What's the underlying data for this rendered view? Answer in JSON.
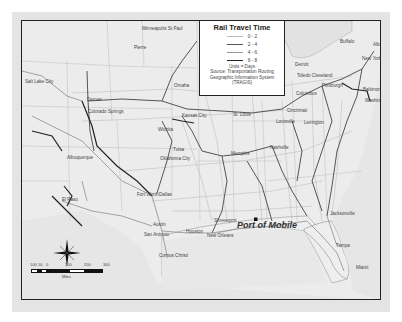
{
  "map": {
    "title": "Rail Travel Time",
    "legend": {
      "title": "Rail Travel Time",
      "classes": [
        {
          "label": "0 - 2",
          "color": "#bdbdbd",
          "width": 0.6
        },
        {
          "label": "2 - 4",
          "color": "#555555",
          "width": 1.0
        },
        {
          "label": "4 - 6",
          "color": "#9a9a9a",
          "width": 0.8
        },
        {
          "label": "6 - 8",
          "color": "#222222",
          "width": 1.3
        }
      ],
      "units": "Units = Days",
      "source_line1": "Source: Transportation Routing",
      "source_line2": "Geographic Information System",
      "source_line3": "(TRAGIS)"
    },
    "highlight": {
      "label": "Port of Mobile",
      "marker": "square"
    },
    "cities": [
      {
        "name": "Minneapolis St Paul",
        "x": 120,
        "y": 6
      },
      {
        "name": "Pierre",
        "x": 112,
        "y": 25
      },
      {
        "name": "Salt Lake City",
        "x": 3,
        "y": 59
      },
      {
        "name": "Omaha",
        "x": 152,
        "y": 63
      },
      {
        "name": "Denver",
        "x": 65,
        "y": 77
      },
      {
        "name": "Colorado Springs",
        "x": 66,
        "y": 89
      },
      {
        "name": "Kansas City",
        "x": 160,
        "y": 93
      },
      {
        "name": "Wichita",
        "x": 136,
        "y": 107
      },
      {
        "name": "Tulsa",
        "x": 151,
        "y": 127
      },
      {
        "name": "Oklahoma City",
        "x": 138,
        "y": 136
      },
      {
        "name": "Albuquerque",
        "x": 45,
        "y": 135
      },
      {
        "name": "El Paso",
        "x": 40,
        "y": 177
      },
      {
        "name": "Fort Worth",
        "x": 115,
        "y": 172
      },
      {
        "name": "Dallas",
        "x": 137,
        "y": 172
      },
      {
        "name": "Austin",
        "x": 131,
        "y": 202
      },
      {
        "name": "San Antonio",
        "x": 122,
        "y": 212
      },
      {
        "name": "Houston",
        "x": 164,
        "y": 209
      },
      {
        "name": "Corpus Christi",
        "x": 137,
        "y": 233
      },
      {
        "name": "New Orleans",
        "x": 185,
        "y": 213
      },
      {
        "name": "Shreveport",
        "x": 192,
        "y": 198
      },
      {
        "name": "St. Louis",
        "x": 211,
        "y": 92
      },
      {
        "name": "Memphis",
        "x": 209,
        "y": 131
      },
      {
        "name": "Nashville",
        "x": 248,
        "y": 125
      },
      {
        "name": "Louisville",
        "x": 254,
        "y": 99
      },
      {
        "name": "Lexington",
        "x": 282,
        "y": 100
      },
      {
        "name": "Cincinnati",
        "x": 265,
        "y": 88
      },
      {
        "name": "Columbus",
        "x": 274,
        "y": 71
      },
      {
        "name": "Detroit",
        "x": 273,
        "y": 42
      },
      {
        "name": "Toledo Cleveland",
        "x": 275,
        "y": 53
      },
      {
        "name": "Buffalo",
        "x": 318,
        "y": 19
      },
      {
        "name": "Albany",
        "x": 351,
        "y": 22
      },
      {
        "name": "New York",
        "x": 340,
        "y": 36
      },
      {
        "name": "Pittsburgh",
        "x": 300,
        "y": 63
      },
      {
        "name": "Baltimore",
        "x": 341,
        "y": 67
      },
      {
        "name": "Washington",
        "x": 343,
        "y": 78
      },
      {
        "name": "Jacksonville",
        "x": 308,
        "y": 191
      },
      {
        "name": "Tampa",
        "x": 314,
        "y": 223
      },
      {
        "name": "Miami",
        "x": 334,
        "y": 245
      }
    ],
    "scale_bar": {
      "ticks": [
        "100",
        "50",
        "0",
        "100",
        "200",
        "300"
      ],
      "unit": "Miles"
    },
    "compass": {
      "n": "N",
      "s": "S",
      "e": "E",
      "w": "W"
    }
  }
}
